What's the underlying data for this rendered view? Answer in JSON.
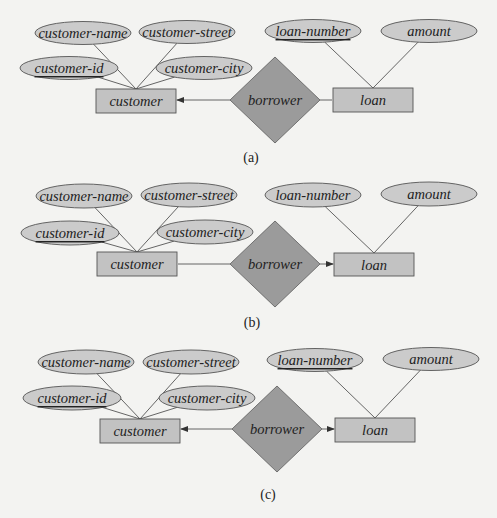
{
  "figure": {
    "background": "#f3f3f1",
    "colors": {
      "attribute_fill": "#cbcbcb",
      "entity_fill": "#c2c2c2",
      "relationship_fill": "#9b9b9b",
      "stroke": "#555555"
    },
    "panels": [
      {
        "caption": "(a)",
        "caption_pos": [
          251,
          157
        ],
        "entities": [
          {
            "id": "customer",
            "label": "customer",
            "x": 96,
            "y": 89,
            "w": 80,
            "h": 24
          },
          {
            "id": "loan",
            "label": "loan",
            "x": 333,
            "y": 88,
            "w": 80,
            "h": 24
          }
        ],
        "relationship": {
          "label": "borrower",
          "cx": 275,
          "cy": 100,
          "hw": 45,
          "hh": 43
        },
        "attributes": [
          {
            "label": "customer-name",
            "cx": 83,
            "cy": 33,
            "rx": 48,
            "ry": 11.5,
            "key": false,
            "entity": "customer"
          },
          {
            "label": "customer-street",
            "cx": 187,
            "cy": 32,
            "rx": 48,
            "ry": 11.5,
            "key": false,
            "entity": "customer"
          },
          {
            "label": "customer-id",
            "cx": 69,
            "cy": 68,
            "rx": 49,
            "ry": 11.5,
            "key": true,
            "entity": "customer"
          },
          {
            "label": "customer-city",
            "cx": 204,
            "cy": 68,
            "rx": 48,
            "ry": 11.5,
            "key": false,
            "entity": "customer"
          },
          {
            "label": "loan-number",
            "cx": 313,
            "cy": 31,
            "rx": 48,
            "ry": 11.5,
            "key": true,
            "entity": "loan"
          },
          {
            "label": "amount",
            "cx": 429,
            "cy": 31,
            "rx": 48,
            "ry": 11.5,
            "key": false,
            "entity": "loan"
          }
        ],
        "arrow_to_customer": true,
        "arrow_to_loan": false
      },
      {
        "caption": "(b)",
        "caption_pos": [
          252,
          322
        ],
        "entities": [
          {
            "id": "customer",
            "label": "customer",
            "x": 97,
            "y": 252,
            "w": 80,
            "h": 24
          },
          {
            "id": "loan",
            "label": "loan",
            "x": 334,
            "y": 253,
            "w": 80,
            "h": 23
          }
        ],
        "relationship": {
          "label": "borrower",
          "cx": 275,
          "cy": 264,
          "hw": 45,
          "hh": 43
        },
        "attributes": [
          {
            "label": "customer-name",
            "cx": 84,
            "cy": 196,
            "rx": 48,
            "ry": 12,
            "key": false,
            "entity": "customer"
          },
          {
            "label": "customer-street",
            "cx": 189,
            "cy": 195,
            "rx": 48,
            "ry": 12,
            "key": false,
            "entity": "customer"
          },
          {
            "label": "customer-id",
            "cx": 70,
            "cy": 233,
            "rx": 49,
            "ry": 12,
            "key": true,
            "entity": "customer"
          },
          {
            "label": "customer-city",
            "cx": 205,
            "cy": 232,
            "rx": 48,
            "ry": 12,
            "key": false,
            "entity": "customer"
          },
          {
            "label": "loan-number",
            "cx": 313,
            "cy": 195,
            "rx": 48,
            "ry": 12,
            "key": false,
            "entity": "loan"
          },
          {
            "label": "amount",
            "cx": 429,
            "cy": 194,
            "rx": 48,
            "ry": 12,
            "key": false,
            "entity": "loan"
          }
        ],
        "arrow_to_customer": false,
        "arrow_to_loan": true
      },
      {
        "caption": "(c)",
        "caption_pos": [
          268,
          494
        ],
        "entities": [
          {
            "id": "customer",
            "label": "customer",
            "x": 100,
            "y": 419,
            "w": 80,
            "h": 24
          },
          {
            "id": "loan",
            "label": "loan",
            "x": 335,
            "y": 418,
            "w": 80,
            "h": 24
          }
        ],
        "relationship": {
          "label": "borrower",
          "cx": 277,
          "cy": 429,
          "hw": 45,
          "hh": 43
        },
        "attributes": [
          {
            "label": "customer-name",
            "cx": 86,
            "cy": 362,
            "rx": 48,
            "ry": 12,
            "key": false,
            "entity": "customer"
          },
          {
            "label": "customer-street",
            "cx": 191,
            "cy": 362,
            "rx": 48,
            "ry": 12,
            "key": false,
            "entity": "customer"
          },
          {
            "label": "customer-id",
            "cx": 72,
            "cy": 398,
            "rx": 49,
            "ry": 12,
            "key": true,
            "entity": "customer"
          },
          {
            "label": "customer-city",
            "cx": 207,
            "cy": 398,
            "rx": 48,
            "ry": 12,
            "key": false,
            "entity": "customer"
          },
          {
            "label": "loan-number",
            "cx": 315,
            "cy": 360,
            "rx": 48,
            "ry": 11.5,
            "key": true,
            "entity": "loan"
          },
          {
            "label": "amount",
            "cx": 431,
            "cy": 359,
            "rx": 48,
            "ry": 11.5,
            "key": false,
            "entity": "loan"
          }
        ],
        "arrow_to_customer": true,
        "arrow_to_loan": true
      }
    ]
  }
}
